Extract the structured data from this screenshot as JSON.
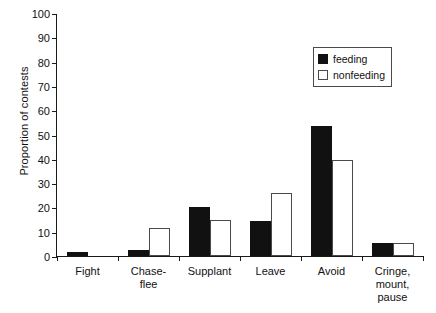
{
  "chart_data": {
    "type": "bar",
    "title": "",
    "xlabel": "",
    "ylabel": "Proportion of contests",
    "ylim": [
      0,
      100
    ],
    "ytick_labels": [
      "0",
      "10",
      "20",
      "30",
      "40",
      "50",
      "60",
      "70",
      "80",
      "90",
      "100"
    ],
    "ytick_values": [
      0,
      10,
      20,
      30,
      40,
      50,
      60,
      70,
      80,
      90,
      100
    ],
    "grid": false,
    "legend_position": "top-right",
    "categories": [
      "Fight",
      "Chase-\nflee",
      "Supplant",
      "Leave",
      "Avoid",
      "Cringe,\nmount,\npause"
    ],
    "category_lines": [
      [
        "Fight"
      ],
      [
        "Chase-",
        "flee"
      ],
      [
        "Supplant"
      ],
      [
        "Leave"
      ],
      [
        "Avoid"
      ],
      [
        "Cringe,",
        "mount,",
        "pause"
      ]
    ],
    "series": [
      {
        "name": "feeding",
        "color": "#111111",
        "values": [
          1.5,
          2.5,
          20,
          14.5,
          53.5,
          5.5
        ]
      },
      {
        "name": "nonfeeding",
        "color": "#ffffff",
        "values": [
          0,
          11.5,
          15,
          26,
          39.5,
          5.5
        ]
      }
    ]
  },
  "legend": {
    "items": [
      {
        "label": "feeding",
        "swatch": "filled-black"
      },
      {
        "label": "nonfeeding",
        "swatch": "open-white"
      }
    ]
  }
}
